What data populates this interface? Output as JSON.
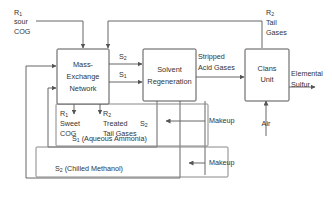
{
  "diagram": {
    "units": [
      {
        "id": "men",
        "lines": [
          "Mass-",
          "Exchange",
          "Network"
        ]
      },
      {
        "id": "regen",
        "lines": [
          "Solvent",
          "Regeneration"
        ]
      },
      {
        "id": "claus",
        "lines": [
          "Clans",
          "Unit"
        ]
      }
    ],
    "streams": {
      "feed_rich_1": {
        "symbol": "R",
        "subscript": "1",
        "line2": "sour",
        "line3": "COG"
      },
      "tail_gases_in": {
        "symbol": "R",
        "subscript": "2",
        "line2": "Tail",
        "line3": "Gases"
      },
      "lean_s2_top": {
        "symbol": "S",
        "subscript": "2"
      },
      "lean_s1_bottom": {
        "symbol": "S",
        "subscript": "1"
      },
      "stripped_acid_gases": {
        "line1": "Stripped",
        "line2": "Acid Gases"
      },
      "elemental_sulfur": {
        "line1": "Elemental",
        "line2": "Sulfur"
      },
      "air": {
        "label": "Air"
      },
      "sweet_cog": {
        "symbol": "R",
        "subscript": "1",
        "line2": "Sweet",
        "line3": "COG"
      },
      "treated_tail_gases": {
        "symbol": "R",
        "subscript": "2",
        "line2": "Treated",
        "line3": "Tail Gases"
      },
      "recycle_s2_mid": {
        "symbol": "S",
        "subscript": "2"
      },
      "makeup_upper": {
        "label": "Makeup"
      },
      "makeup_lower": {
        "label": "Makeup"
      }
    },
    "groups": [
      {
        "id": "s1_group",
        "symbol": "S",
        "subscript": "1",
        "name": "(Aqueous Ammonia)"
      },
      {
        "id": "s2_group",
        "symbol": "S",
        "subscript": "2",
        "name": "(Chilled Methanol)"
      }
    ],
    "colors": {
      "box_stroke": "#555555",
      "group_stroke": "#888888",
      "line": "#666666",
      "text": "#333333",
      "background": "#ffffff"
    }
  }
}
